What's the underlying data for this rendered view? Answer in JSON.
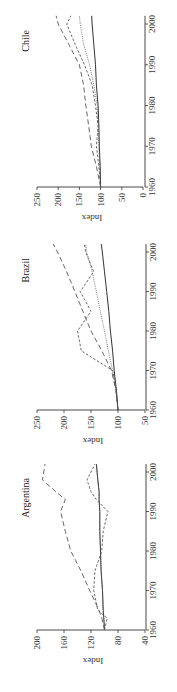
{
  "chart_data": [
    {
      "type": "line",
      "title": "Chile",
      "xlabel": "",
      "ylabel": "Index",
      "x_ticks": [
        1960,
        1970,
        1980,
        1990,
        2000
      ],
      "y_ticks": [
        0,
        50,
        100,
        150,
        200,
        250
      ],
      "ylim": [
        0,
        250
      ],
      "xlim": [
        1960,
        2002
      ],
      "grid": false,
      "orientation": "rotated 90 degrees counterclockwise",
      "x": [
        1960,
        1965,
        1970,
        1975,
        1980,
        1985,
        1990,
        1995,
        2000,
        2002
      ],
      "series": [
        {
          "name": "solid",
          "style": "solid",
          "values": [
            100,
            101,
            103,
            104,
            106,
            110,
            112,
            116,
            120,
            121
          ]
        },
        {
          "name": "dotted",
          "style": "dotted",
          "values": [
            100,
            102,
            104,
            106,
            108,
            116,
            126,
            140,
            148,
            150
          ]
        },
        {
          "name": "short-dashed",
          "style": "short-dashed",
          "values": [
            100,
            104,
            110,
            106,
            112,
            120,
            138,
            160,
            180,
            170
          ]
        },
        {
          "name": "long-dashed",
          "style": "long-dashed",
          "values": [
            100,
            110,
            122,
            128,
            135,
            140,
            150,
            175,
            200,
            205
          ]
        }
      ]
    },
    {
      "type": "line",
      "title": "Brazil",
      "xlabel": "",
      "ylabel": "Index",
      "x_ticks": [
        1960,
        1970,
        1980,
        1990,
        2000
      ],
      "y_ticks": [
        50,
        100,
        150,
        200,
        250
      ],
      "ylim": [
        50,
        250
      ],
      "xlim": [
        1960,
        2002
      ],
      "grid": false,
      "orientation": "rotated 90 degrees counterclockwise",
      "x": [
        1960,
        1965,
        1970,
        1975,
        1980,
        1985,
        1990,
        1995,
        2000,
        2002
      ],
      "series": [
        {
          "name": "solid",
          "style": "solid",
          "values": [
            100,
            103,
            107,
            110,
            114,
            117,
            121,
            125,
            129,
            131
          ]
        },
        {
          "name": "dotted",
          "style": "dotted",
          "values": [
            100,
            104,
            110,
            118,
            125,
            133,
            140,
            148,
            158,
            160
          ]
        },
        {
          "name": "short-dashed",
          "style": "short-dashed",
          "values": [
            100,
            103,
            110,
            168,
            175,
            150,
            170,
            145,
            160,
            162
          ]
        },
        {
          "name": "long-dashed",
          "style": "long-dashed",
          "values": [
            100,
            104,
            112,
            130,
            150,
            165,
            180,
            195,
            212,
            220
          ]
        }
      ]
    },
    {
      "type": "line",
      "title": "Argentina",
      "xlabel": "",
      "ylabel": "Index",
      "x_ticks": [
        1960,
        1970,
        1980,
        1990,
        2000
      ],
      "y_ticks": [
        40,
        80,
        120,
        160,
        200
      ],
      "ylim": [
        40,
        200
      ],
      "xlim": [
        1960,
        2002
      ],
      "grid": false,
      "orientation": "rotated 90 degrees counterclockwise",
      "x": [
        1960,
        1963,
        1965,
        1970,
        1975,
        1980,
        1985,
        1990,
        1993,
        1995,
        1998,
        2002
      ],
      "series": [
        {
          "name": "solid",
          "style": "solid",
          "values": [
            100,
            101,
            102,
            103,
            105,
            106,
            107,
            107,
            108,
            108,
            110,
            112
          ]
        },
        {
          "name": "dotted",
          "style": "dotted",
          "values": [
            100,
            101,
            102,
            103,
            105,
            106,
            107,
            107,
            108,
            108,
            110,
            112
          ]
        },
        {
          "name": "short-dashed",
          "style": "short-dashed",
          "values": [
            100,
            96,
            110,
            116,
            114,
            104,
            102,
            95,
            112,
            120,
            126,
            114
          ]
        },
        {
          "name": "long-dashed",
          "style": "long-dashed",
          "values": [
            100,
            104,
            108,
            122,
            135,
            150,
            158,
            165,
            158,
            172,
            192,
            188
          ]
        }
      ]
    }
  ]
}
